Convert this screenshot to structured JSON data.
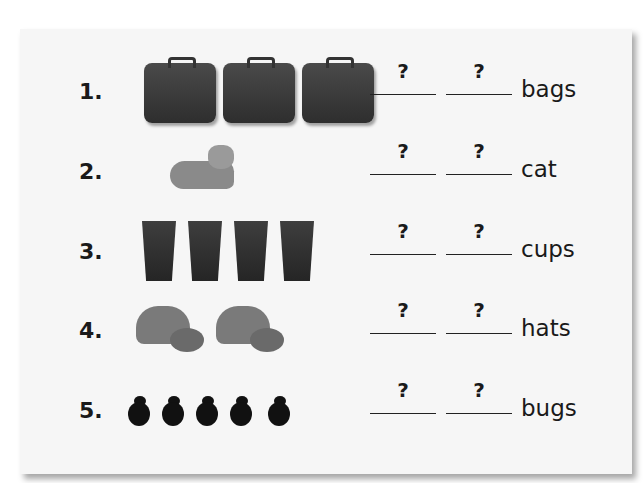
{
  "worksheet": {
    "rows": [
      {
        "number": "1.",
        "item": "suitcase",
        "count_shown": 3,
        "blank1": "?",
        "blank2": "?",
        "word": "bags"
      },
      {
        "number": "2.",
        "item": "cat",
        "count_shown": 1,
        "blank1": "?",
        "blank2": "?",
        "word": "cat"
      },
      {
        "number": "3.",
        "item": "cup",
        "count_shown": 4,
        "blank1": "?",
        "blank2": "?",
        "word": "cups"
      },
      {
        "number": "4.",
        "item": "hat",
        "count_shown": 2,
        "blank1": "?",
        "blank2": "?",
        "word": "hats"
      },
      {
        "number": "5.",
        "item": "bug",
        "count_shown": 5,
        "blank1": "?",
        "blank2": "?",
        "word": "bugs"
      }
    ]
  },
  "colors": {
    "card": "#f6f6f6",
    "text": "#1a1a1a"
  }
}
